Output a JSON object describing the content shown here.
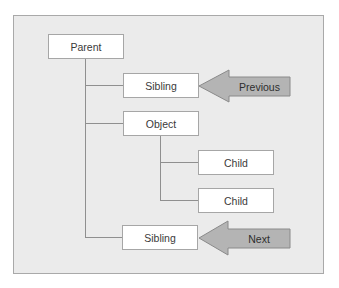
{
  "diagram": {
    "type": "tree-navigation",
    "colors": {
      "panel_background": "#ebebeb",
      "panel_border": "#a9a9a9",
      "node_background": "#ffffff",
      "node_border": "#a6a6a6",
      "connector": "#8f8f8f",
      "arrow_fill": "#b4b4b4",
      "arrow_stroke": "#8a8a8a"
    },
    "nodes": {
      "parent": "Parent",
      "sibling_previous": "Sibling",
      "object": "Object",
      "child_1": "Child",
      "child_2": "Child",
      "sibling_next": "Sibling"
    },
    "arrows": {
      "previous": "Previous",
      "next": "Next"
    }
  }
}
